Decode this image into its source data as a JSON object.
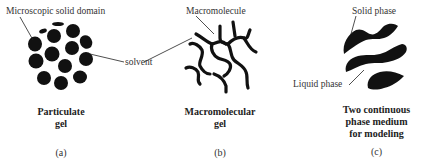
{
  "panels": [
    {
      "id": "a",
      "caption_line1": "Particulate",
      "caption_line2": "gel",
      "letter": "(a)",
      "labels": {
        "domain": "Microscopic solid domain",
        "solvent": "solvent"
      }
    },
    {
      "id": "b",
      "caption_line1": "Macromolecular",
      "caption_line2": "gel",
      "letter": "(b)",
      "labels": {
        "macromolecule": "Macromolecule"
      }
    },
    {
      "id": "c",
      "caption_line1": "Two continuous",
      "caption_line2": "phase medium",
      "caption_line3": "for modeling",
      "letter": "(c)",
      "labels": {
        "solid": "Solid phase",
        "liquid": "Liquid phase"
      }
    }
  ],
  "colors": {
    "ink": "#111111",
    "text": "#333333",
    "background": "#ffffff"
  }
}
